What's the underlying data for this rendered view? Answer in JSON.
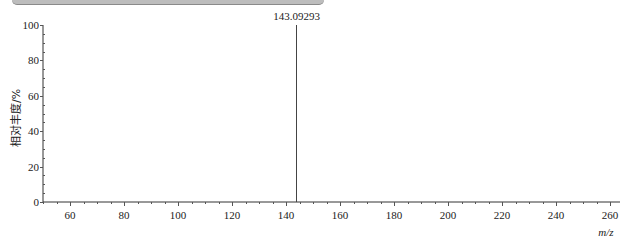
{
  "chart_data": {
    "type": "bar",
    "subtype": "mass-spectrum-stick",
    "title": "",
    "xlabel": "m/z",
    "ylabel": "相对丰度/%",
    "xlim": [
      50,
      265
    ],
    "ylim": [
      0,
      100
    ],
    "x_ticks": [
      60,
      80,
      100,
      120,
      140,
      160,
      180,
      200,
      220,
      240,
      260
    ],
    "y_ticks": [
      0,
      20,
      40,
      60,
      80,
      100
    ],
    "grid": false,
    "legend": null,
    "peaks": [
      {
        "mz": 143.09293,
        "relative_abundance": 100,
        "label": "143.09293"
      }
    ]
  },
  "labels": {
    "ylabel": "相对丰度/%",
    "xlabel": "m/z",
    "peak_label": "143.09293",
    "x_ticks": [
      "60",
      "80",
      "100",
      "120",
      "140",
      "160",
      "180",
      "200",
      "220",
      "240",
      "260"
    ],
    "y_ticks": [
      "0",
      "20",
      "40",
      "60",
      "80",
      "100"
    ]
  }
}
